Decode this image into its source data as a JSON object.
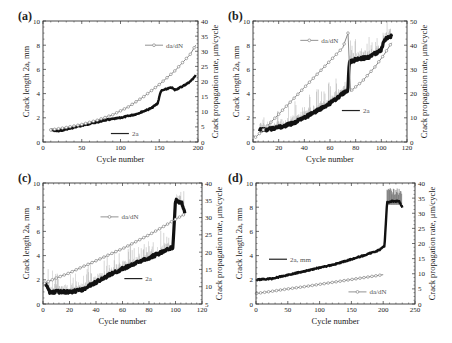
{
  "chart_data": [
    {
      "panel": "(a)",
      "type": "line",
      "title": "",
      "xlabel": "Cycle number",
      "ylabel": "Crack length 2a, mm",
      "y2label": "Crack propagation rate, μm/cycle",
      "xlim": [
        0,
        200
      ],
      "ylim": [
        0,
        10
      ],
      "y2lim": [
        0,
        40
      ],
      "xticks": [
        0,
        50,
        100,
        150,
        200
      ],
      "yticks": [
        0,
        2,
        4,
        6,
        8,
        10
      ],
      "y2ticks": [
        0,
        5,
        10,
        15,
        20,
        25,
        30,
        35,
        40
      ],
      "legend": [
        {
          "label": "da/dN",
          "marker": "circle",
          "position": [
            0.8,
            0.2
          ]
        },
        {
          "label": "2a",
          "marker": "line",
          "position": [
            0.58,
            0.93
          ]
        }
      ],
      "grid": false,
      "series": [
        {
          "name": "2a",
          "axis": "left",
          "style": "noisy-thick",
          "x": [
            10,
            20,
            40,
            60,
            80,
            100,
            120,
            140,
            148,
            152,
            160,
            166,
            170,
            180,
            190,
            197
          ],
          "y": [
            1.0,
            0.9,
            1.2,
            1.5,
            1.8,
            2.0,
            2.3,
            2.8,
            3.2,
            4.2,
            4.4,
            4.5,
            4.3,
            4.6,
            5.0,
            5.5
          ]
        },
        {
          "name": "da/dN",
          "axis": "right",
          "style": "circle-line",
          "x": [
            10,
            30,
            50,
            70,
            90,
            110,
            130,
            150,
            170,
            190,
            197
          ],
          "y": [
            4.0,
            4.8,
            5.8,
            7.2,
            9.0,
            11.6,
            15.0,
            19.0,
            23.5,
            29.0,
            32.0
          ]
        }
      ]
    },
    {
      "panel": "(b)",
      "type": "line",
      "title": "",
      "xlabel": "Cycle number",
      "ylabel": "Crack length 2a, mm",
      "y2label": "Crack propagation rate, μm/cycle",
      "xlim": [
        0,
        120
      ],
      "ylim": [
        0,
        10
      ],
      "y2lim": [
        0,
        50
      ],
      "xticks": [
        0,
        20,
        40,
        60,
        80,
        100,
        120
      ],
      "yticks": [
        0,
        2,
        4,
        6,
        8,
        10
      ],
      "y2ticks": [
        0,
        10,
        20,
        30,
        40,
        50
      ],
      "legend": [
        {
          "label": "da/dN",
          "marker": "circle",
          "position": [
            0.45,
            0.16
          ]
        },
        {
          "label": "2a",
          "marker": "line",
          "position": [
            0.72,
            0.74
          ]
        }
      ],
      "grid": false,
      "series": [
        {
          "name": "2a",
          "axis": "left",
          "style": "noisy-thick",
          "x": [
            5,
            10,
            20,
            30,
            40,
            50,
            60,
            70,
            74,
            75,
            80,
            90,
            100,
            102,
            105,
            108
          ],
          "y": [
            1.0,
            1.0,
            1.2,
            1.5,
            2.0,
            2.6,
            3.2,
            4.0,
            4.3,
            6.6,
            6.8,
            7.0,
            7.6,
            8.4,
            8.6,
            8.8
          ]
        },
        {
          "name": "da/dN",
          "axis": "right",
          "style": "circle-line",
          "x": [
            2,
            10,
            20,
            30,
            40,
            50,
            60,
            70,
            74,
            76,
            85,
            95,
            102,
            108
          ],
          "y": [
            2.0,
            6.0,
            11.5,
            17.0,
            22.5,
            28.0,
            33.5,
            39.0,
            45.0,
            21.0,
            25.0,
            31.0,
            36.0,
            41.0
          ]
        }
      ]
    },
    {
      "panel": "(c)",
      "type": "line",
      "title": "",
      "xlabel": "Cycle number",
      "ylabel": "Crack length 2a, mm",
      "y2label": "Crack propagation rate, μm/cycle",
      "xlim": [
        0,
        120
      ],
      "ylim": [
        0,
        10
      ],
      "y2lim": [
        5,
        40
      ],
      "xticks": [
        0,
        20,
        40,
        60,
        80,
        100,
        120
      ],
      "yticks": [
        0,
        2,
        4,
        6,
        8,
        10
      ],
      "y2ticks": [
        5,
        10,
        15,
        20,
        25,
        30,
        35,
        40
      ],
      "legend": [
        {
          "label": "da/dN",
          "marker": "circle",
          "position": [
            0.5,
            0.28
          ]
        },
        {
          "label": "2a",
          "marker": "line",
          "position": [
            0.65,
            0.79
          ]
        }
      ],
      "grid": false,
      "series": [
        {
          "name": "2a",
          "axis": "left",
          "style": "noisy-thick",
          "x": [
            2,
            5,
            10,
            20,
            30,
            40,
            50,
            60,
            70,
            80,
            90,
            98,
            100,
            102,
            105,
            107
          ],
          "y": [
            1.6,
            1.0,
            1.0,
            1.0,
            1.2,
            1.8,
            2.4,
            2.9,
            3.4,
            3.8,
            4.3,
            4.7,
            8.6,
            8.4,
            8.3,
            7.6
          ]
        },
        {
          "name": "da/dN",
          "axis": "right",
          "style": "circle-line",
          "x": [
            1,
            10,
            20,
            30,
            40,
            50,
            60,
            70,
            80,
            90,
            100,
            107
          ],
          "y": [
            11.0,
            12.5,
            14.0,
            15.8,
            17.5,
            19.3,
            21.0,
            23.0,
            25.0,
            27.2,
            29.5,
            31.0
          ]
        }
      ]
    },
    {
      "panel": "(d)",
      "type": "line",
      "title": "",
      "xlabel": "Cycle number",
      "ylabel": "Crack length 2a, mm",
      "y2label": "Crack propagation rate, μm/cycle",
      "xlim": [
        0,
        250
      ],
      "ylim": [
        0,
        10
      ],
      "y2lim": [
        0,
        40
      ],
      "xticks": [
        0,
        50,
        100,
        150,
        200,
        250
      ],
      "yticks": [
        0,
        2,
        4,
        6,
        8,
        10
      ],
      "y2ticks": [
        0,
        5,
        10,
        15,
        20,
        25,
        30,
        35,
        40
      ],
      "legend": [
        {
          "label": "2a, mm",
          "marker": "line",
          "position": [
            0.22,
            0.63
          ]
        },
        {
          "label": "da/dN",
          "marker": "circle",
          "position": [
            0.72,
            0.9
          ]
        }
      ],
      "grid": false,
      "series": [
        {
          "name": "2a, mm",
          "axis": "left",
          "style": "noisy-thick",
          "x": [
            1,
            25,
            50,
            75,
            100,
            125,
            150,
            175,
            195,
            202,
            206,
            215,
            225,
            230
          ],
          "y": [
            2.0,
            2.1,
            2.4,
            2.7,
            3.0,
            3.3,
            3.7,
            4.1,
            4.5,
            4.8,
            8.4,
            8.5,
            8.5,
            8.0
          ]
        },
        {
          "name": "da/dN",
          "axis": "right",
          "style": "circle-line",
          "x": [
            1,
            25,
            50,
            75,
            100,
            125,
            150,
            175,
            200
          ],
          "y": [
            3.5,
            4.2,
            5.0,
            5.7,
            6.5,
            7.3,
            8.1,
            8.9,
            9.7
          ]
        }
      ]
    }
  ]
}
